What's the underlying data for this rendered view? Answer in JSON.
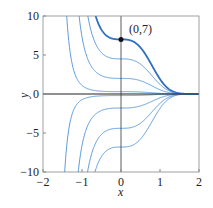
{
  "chart_data": {
    "type": "line",
    "title": "",
    "xlabel": "x",
    "ylabel": "y",
    "xlim": [
      -2,
      2
    ],
    "ylim": [
      -10,
      10
    ],
    "xticks": [
      -2,
      -1,
      0,
      1,
      2
    ],
    "yticks": [
      -10,
      -5,
      0,
      5,
      10
    ],
    "grid": false,
    "legend": false,
    "annotation": {
      "label": "(0,7)",
      "x": 0,
      "y": 7
    },
    "highlighted_series": "C=7",
    "series": [
      {
        "name": "C=7",
        "value_at_x0": 7,
        "highlight": true
      },
      {
        "name": "C=4.5",
        "value_at_x0": 4.5
      },
      {
        "name": "C=2",
        "value_at_x0": 2
      },
      {
        "name": "C=0.3",
        "value_at_x0": 0.3
      },
      {
        "name": "C=0",
        "value_at_x0": 0,
        "axis_line": true
      },
      {
        "name": "C=-0.2",
        "value_at_x0": -0.2
      },
      {
        "name": "C=-1.8",
        "value_at_x0": -1.8
      },
      {
        "name": "C=-4.4",
        "value_at_x0": -4.4
      },
      {
        "name": "C=-6.8",
        "value_at_x0": -6.8
      }
    ],
    "model": "y = C*exp(-k*x^3), k=1.3",
    "colors": {
      "curve": "#4a90d9",
      "highlight": "#2f6fc0",
      "axis": "#222222",
      "frame": "#888888"
    }
  }
}
